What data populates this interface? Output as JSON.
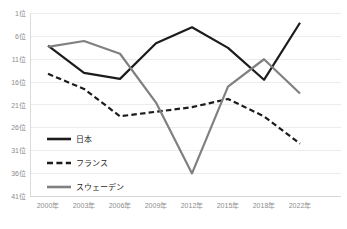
{
  "chart_data": {
    "type": "line",
    "title": "",
    "subtitle": "",
    "xlabel": "",
    "ylabel": "",
    "categories": [
      "2000年",
      "2003年",
      "2006年",
      "2009年",
      "2012年",
      "2015年",
      "2018年",
      "2022年"
    ],
    "y_tick_labels": [
      "1位",
      "6位",
      "11位",
      "16位",
      "21位",
      "26位",
      "31位",
      "36位",
      "41位"
    ],
    "y_tick_values": [
      1,
      6,
      11,
      16,
      21,
      26,
      31,
      36,
      41
    ],
    "ylim": [
      1,
      41
    ],
    "y_axis_inverted": true,
    "grid": "horizontal",
    "legend_position": "inside-bottom-left",
    "series": [
      {
        "name": "日本",
        "color": "#1c1c1c",
        "style": "solid",
        "width": 2.2,
        "values": [
          8,
          14,
          15.3,
          7.5,
          4,
          8.5,
          15.5,
          3
        ]
      },
      {
        "name": "フランス",
        "color": "#1c1c1c",
        "style": "dashed",
        "width": 2.2,
        "values": [
          14.2,
          17.5,
          23.5,
          22.5,
          21.5,
          19.7,
          23.5,
          29.5
        ]
      },
      {
        "name": "スウェーデン",
        "color": "#808080",
        "style": "solid",
        "width": 2.2,
        "values": [
          8.3,
          7,
          9.8,
          20.5,
          36,
          17,
          11,
          18.5
        ]
      }
    ]
  },
  "legend": {
    "items": [
      {
        "label": "日本"
      },
      {
        "label": "フランス"
      },
      {
        "label": "スウェーデン"
      }
    ]
  }
}
